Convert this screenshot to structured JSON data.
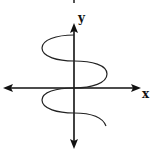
{
  "diagram": {
    "type": "graph-of-relation",
    "axes": {
      "x_label": "x",
      "y_label": "y",
      "x_arrows": "both-ends",
      "y_arrows": "both-ends"
    },
    "colors": {
      "stroke": "#111111",
      "background": "#ffffff"
    }
  }
}
